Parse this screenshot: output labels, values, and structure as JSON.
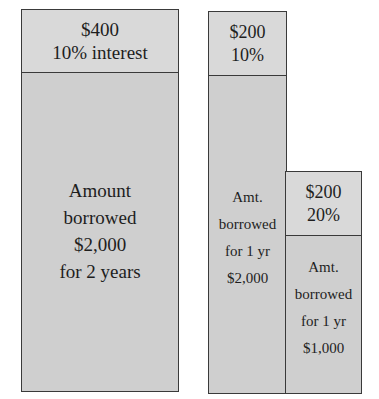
{
  "diagram": {
    "title": "",
    "colors": {
      "fill": "#d3d3d3",
      "border": "#3a3a3a",
      "text": "#1e1e1e"
    },
    "left_block": {
      "interest": {
        "lines": [
          "$400",
          "10% interest"
        ]
      },
      "principal": {
        "lines": [
          "Amount",
          "borrowed",
          "$2,000",
          "for 2 years"
        ]
      }
    },
    "middle_block": {
      "interest": {
        "lines": [
          "$200",
          "10%"
        ]
      },
      "principal": {
        "lines": [
          "Amt.",
          "borrowed",
          "for 1 yr",
          "$2,000"
        ]
      }
    },
    "right_block": {
      "interest": {
        "lines": [
          "$200",
          "20%"
        ]
      },
      "principal": {
        "lines": [
          "Amt.",
          "borrowed",
          "for 1 yr",
          "$1,000"
        ]
      }
    }
  }
}
